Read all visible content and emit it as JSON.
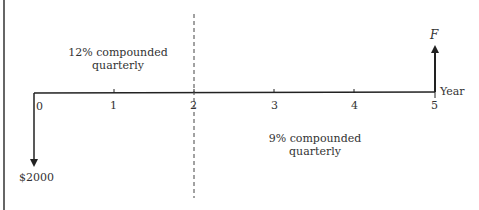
{
  "diagram": {
    "type": "cash-flow-timeline",
    "axis_label": "Year",
    "ticks": [
      "0",
      "1",
      "2",
      "3",
      "4",
      "5"
    ],
    "period_1_note": {
      "line1": "12% compounded",
      "line2": "quarterly"
    },
    "period_2_note": {
      "line1": "9% compounded",
      "line2": "quarterly"
    },
    "cash_flows": [
      {
        "year": 0,
        "direction": "down",
        "label": "$2000"
      },
      {
        "year": 5,
        "direction": "up",
        "label": "F"
      }
    ],
    "divider_at_year": 2
  }
}
